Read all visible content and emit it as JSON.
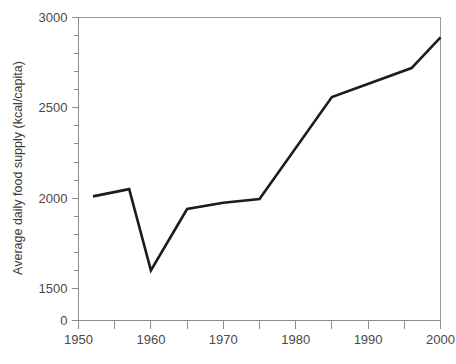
{
  "chart_data": {
    "type": "line",
    "title": "",
    "xlabel": "",
    "ylabel": "Average daily food supply (kcal/capita)",
    "xlim": [
      1950,
      2000
    ],
    "ylim": [
      1450,
      3000
    ],
    "axis_break": true,
    "axis_break_note": "y-axis is broken between 0 and 1500",
    "grid": false,
    "legend": null,
    "x": [
      1952,
      1957,
      1960,
      1965,
      1970,
      1975,
      1985,
      1996,
      2000
    ],
    "values": [
      2010,
      2050,
      1600,
      1940,
      1975,
      1995,
      2560,
      2720,
      2890
    ],
    "series": [
      {
        "name": "Average daily food supply",
        "color": "#1c1c1c",
        "points": [
          {
            "x": 1952,
            "y": 2010
          },
          {
            "x": 1957,
            "y": 2050
          },
          {
            "x": 1960,
            "y": 1600
          },
          {
            "x": 1965,
            "y": 1940
          },
          {
            "x": 1970,
            "y": 1975
          },
          {
            "x": 1975,
            "y": 1995
          },
          {
            "x": 1985,
            "y": 2560
          },
          {
            "x": 1996,
            "y": 2720
          },
          {
            "x": 2000,
            "y": 2890
          }
        ]
      }
    ],
    "y_ticks_major": [
      {
        "value": 3000,
        "label": "3000"
      },
      {
        "value": 2500,
        "label": "2500"
      },
      {
        "value": 2000,
        "label": "2000"
      },
      {
        "value": 1500,
        "label": "1500"
      },
      {
        "value": 0,
        "label": "0"
      }
    ],
    "y_ticks_minor": [
      2900,
      2800,
      2700,
      2600,
      2400,
      2300,
      2200,
      2100,
      1900,
      1800,
      1700,
      1600
    ],
    "x_ticks_major": [
      {
        "value": 1950,
        "label": "1950"
      },
      {
        "value": 1960,
        "label": "1960"
      },
      {
        "value": 1970,
        "label": "1970"
      },
      {
        "value": 1980,
        "label": "1980"
      },
      {
        "value": 1990,
        "label": "1990"
      },
      {
        "value": 2000,
        "label": "2000"
      }
    ],
    "x_ticks_minor": [
      1955,
      1965,
      1975,
      1985,
      1995
    ]
  },
  "colors": {
    "line": "#1c1c1c",
    "axis": "#8c8c8c",
    "frame": "#9a9a9a",
    "text": "#3a3a3a",
    "background": "#ffffff"
  }
}
